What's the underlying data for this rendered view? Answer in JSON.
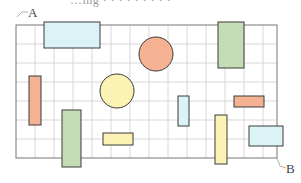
{
  "caption": {
    "text": "…ing · · · · · · · · ·"
  },
  "labels": {
    "a": "A",
    "b": "B"
  },
  "grid": {
    "x": 16,
    "y": 25,
    "width": 261,
    "height": 133,
    "cell": 19,
    "line_color": "#d8d8d8",
    "border_color": "#777777"
  },
  "colors": {
    "orange": "#f4b293",
    "yellow": "#fbf3b4",
    "green": "#c3deb6",
    "blue": "#dbf2f6",
    "stroke": "#3a3a3a"
  },
  "shapes": [
    {
      "type": "rect",
      "name": "blue-wide-rect-top",
      "x": 44,
      "y": 22,
      "w": 56,
      "h": 26,
      "fill": "blue"
    },
    {
      "type": "circle",
      "name": "orange-circle",
      "cx": 156,
      "cy": 54,
      "r": 17,
      "fill": "orange"
    },
    {
      "type": "rect",
      "name": "green-rect-top",
      "x": 218,
      "y": 22,
      "w": 26,
      "h": 46,
      "fill": "green"
    },
    {
      "type": "rect",
      "name": "orange-tall-rect",
      "x": 29,
      "y": 76,
      "w": 12,
      "h": 49,
      "fill": "orange"
    },
    {
      "type": "circle",
      "name": "yellow-circle",
      "cx": 117,
      "cy": 91,
      "r": 17,
      "fill": "yellow"
    },
    {
      "type": "rect",
      "name": "green-tall-rect",
      "x": 62,
      "y": 110,
      "w": 19,
      "h": 57,
      "fill": "green"
    },
    {
      "type": "rect",
      "name": "yellow-small-rect",
      "x": 103,
      "y": 133,
      "w": 30,
      "h": 12,
      "fill": "yellow"
    },
    {
      "type": "rect",
      "name": "blue-narrow-rect",
      "x": 178,
      "y": 96,
      "w": 11,
      "h": 30,
      "fill": "blue"
    },
    {
      "type": "rect",
      "name": "orange-small-rect",
      "x": 234,
      "y": 96,
      "w": 30,
      "h": 11,
      "fill": "orange"
    },
    {
      "type": "rect",
      "name": "yellow-tall-rect",
      "x": 215,
      "y": 115,
      "w": 12,
      "h": 49,
      "fill": "yellow"
    },
    {
      "type": "rect",
      "name": "blue-rect-bottom-right",
      "x": 249,
      "y": 126,
      "w": 34,
      "h": 20,
      "fill": "blue"
    }
  ]
}
